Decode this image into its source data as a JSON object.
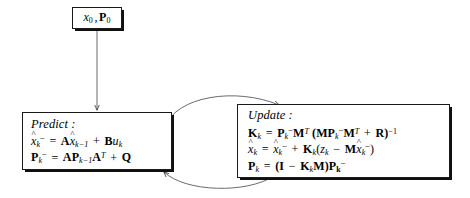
{
  "diagram": {
    "init_node": {
      "label": "x0, P0",
      "parts": {
        "x": "x",
        "x_sub": "0",
        "comma": ",",
        "P": "P",
        "P_sub": "0"
      }
    },
    "predict_node": {
      "header": "Predict :",
      "lines": [
        "x̂⁻k = A x̂k−1 + B uk",
        "P⁻k = A Pk−1 AT + Q"
      ],
      "tokens": {
        "l1": {
          "xhat": "x",
          "sub_k": "k",
          "minus": "−",
          "eq": "=",
          "A": "A",
          "xhat2": "x",
          "sub_km1": "k−1",
          "plus": "+",
          "B": "B",
          "u": "u",
          "u_sub": "k"
        },
        "l2": {
          "P": "P",
          "sub_k": "k",
          "minus": "−",
          "eq": "=",
          "A": "A",
          "P2": "P",
          "sub_km1": "k−1",
          "A2": "A",
          "T": "T",
          "plus": "+",
          "Q": "Q"
        }
      }
    },
    "update_node": {
      "header": "Update :",
      "lines": [
        "Kk = P⁻k MT (M P⁻k MT + R)−1",
        "x̂k = x̂⁻k + Kk(zk − M x̂⁻k)",
        "Pk = (I − Kk M) P⁻k"
      ],
      "tokens": {
        "l1": {
          "K": "K",
          "K_sub": "k",
          "eq": "=",
          "P": "P",
          "P_sub": "k",
          "minus_sup": "−",
          "M": "M",
          "T": "T",
          "lparen": "(",
          "M2": "M",
          "P2": "P",
          "P2_sub": "k",
          "M3": "M",
          "T2": "T",
          "plus": "+",
          "R": "R",
          "rparen": ")",
          "inv": "−1"
        },
        "l2": {
          "xhat": "x",
          "x_sub": "k",
          "eq": "=",
          "xhat2": "x",
          "x2_sub": "k",
          "minus_sup": "−",
          "plus": "+",
          "K": "K",
          "K_sub": "k",
          "lparen": "(",
          "z": "z",
          "z_sub": "k",
          "minus": "−",
          "M": "M",
          "xhat3": "x",
          "x3_sub": "k",
          "rparen": ")"
        },
        "l3": {
          "P": "P",
          "P_sub": "k",
          "eq": "=",
          "lparen": "(",
          "I": "I",
          "minus": "−",
          "K": "K",
          "K_sub": "k",
          "M": "M",
          "rparen": ")",
          "P2": "P",
          "P2_sub": "k",
          "minus_sup": "−"
        }
      }
    },
    "edges": [
      {
        "name": "init-to-predict",
        "kind": "straight-down-arrow"
      },
      {
        "name": "predict-to-update",
        "kind": "curve-arrow-top"
      },
      {
        "name": "update-to-predict",
        "kind": "curve-arrow-bottom"
      }
    ],
    "colors": {
      "background": "#ffffff",
      "stroke": "#1a1a1a",
      "shadow": "#101010",
      "arrow": "#4a4a4a",
      "text": "#000000"
    }
  }
}
